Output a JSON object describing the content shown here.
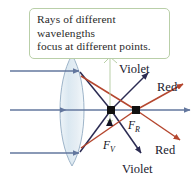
{
  "figure": {
    "name": "chromatic-aberration-lens-diagram",
    "width": 195,
    "height": 186,
    "background": "#ffffff"
  },
  "callout": {
    "line1": "Rays of different wavelengths",
    "line2": "focus at different points.",
    "border_color": "#b9cfa8",
    "leader_color": "#b9cfa8",
    "text_color": "#2a2a2a"
  },
  "labels": {
    "violet_top": "Violet",
    "violet_bottom": "Violet",
    "red_top": "Red",
    "red_bottom": "Red",
    "focal_violet_letter": "F",
    "focal_violet_sub": "V",
    "focal_red_letter": "F",
    "focal_red_sub": "R"
  },
  "colors": {
    "incoming_ray": "#63779e",
    "violet_ray": "#2b2b52",
    "red_ray": "#b5472f",
    "lens_fill": "#dfe9f0",
    "lens_stroke": "#9db4c9",
    "axis": "#63779e",
    "focal_dot": "#111111",
    "label_dark": "#1a1a2e"
  },
  "geometry": {
    "axis_y": 110,
    "focal_violet_x": 111,
    "focal_red_x": 136,
    "lens_center_x": 72,
    "lens_top_y": 55,
    "lens_bottom_y": 166
  }
}
